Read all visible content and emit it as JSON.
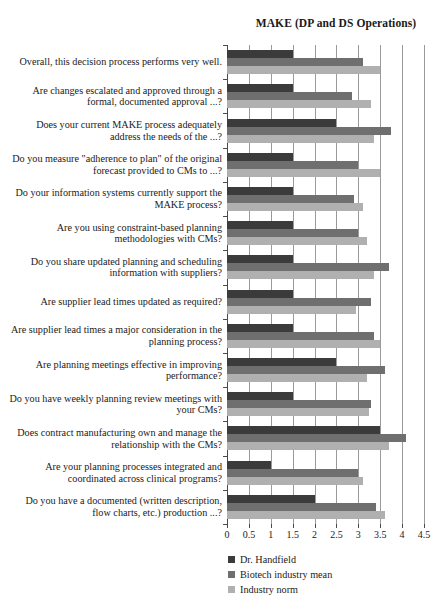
{
  "chart_data": {
    "type": "bar",
    "orientation": "horizontal",
    "title": "MAKE (DP and DS Operations)",
    "xlabel": "",
    "ylabel": "",
    "xlim": [
      0,
      4.5
    ],
    "xticks": [
      "0",
      "0.5",
      "1",
      "1.5",
      "2",
      "2.5",
      "3",
      "3.5",
      "4",
      "4.5"
    ],
    "xtick_values": [
      0,
      0.5,
      1,
      1.5,
      2,
      2.5,
      3,
      3.5,
      4,
      4.5
    ],
    "grid": true,
    "legend_position": "below-left",
    "categories": [
      "Overall, this decision process performs very well.",
      "Are changes escalated and approved through a formal, documented approval ...?",
      "Does your current MAKE process adequately address the needs of the ...?",
      "Do you measure \"adherence to plan\" of the original forecast provided to CMs to ...?",
      "Do your information systems currently support the MAKE process?",
      "Are you using constraint-based planning methodologies with CMs?",
      "Do you share updated planning and scheduling information with suppliers?",
      "Are supplier lead times updated as required?",
      "Are supplier lead times a major consideration in the planning process?",
      "Are planning meetings effective in improving performance?",
      "Do you have weekly planning review meetings with your CMs?",
      "Does contract manufacturing own and manage the relationship with the CMs?",
      "Are your planning processes integrated and coordinated across clinical programs?",
      "Do you have a documented (written description, flow charts, etc.) production ...?"
    ],
    "series": [
      {
        "name": "Dr. Handfield",
        "color": "#3b3b3b",
        "values": [
          1.5,
          1.5,
          2.5,
          1.5,
          1.5,
          1.5,
          1.5,
          1.5,
          1.5,
          2.5,
          1.5,
          3.5,
          1.0,
          2.0
        ]
      },
      {
        "name": "Biotech industry mean",
        "color": "#6f6f6f",
        "values": [
          3.1,
          2.85,
          3.75,
          3.0,
          2.9,
          3.0,
          3.7,
          3.3,
          3.35,
          3.6,
          3.3,
          4.1,
          3.0,
          3.4
        ]
      },
      {
        "name": "Industry norm",
        "color": "#b0b0b0",
        "values": [
          3.5,
          3.3,
          3.35,
          3.5,
          3.1,
          3.2,
          3.35,
          2.95,
          3.5,
          3.2,
          3.25,
          3.7,
          3.1,
          3.6
        ]
      }
    ]
  },
  "legend": {
    "items": [
      {
        "label": "Dr. Handfield",
        "color": "#3b3b3b"
      },
      {
        "label": "Biotech industry mean",
        "color": "#6f6f6f"
      },
      {
        "label": "Industry norm",
        "color": "#b0b0b0"
      }
    ]
  }
}
